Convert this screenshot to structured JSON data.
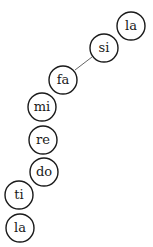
{
  "diagram": {
    "type": "solfege-scale-bubbles",
    "nodes": [
      {
        "id": "la_top",
        "label": "la",
        "cx": 131,
        "cy": 26
      },
      {
        "id": "si",
        "label": "si",
        "cx": 104,
        "cy": 48
      },
      {
        "id": "fa",
        "label": "fa",
        "cx": 63,
        "cy": 80
      },
      {
        "id": "mi",
        "label": "mi",
        "cx": 42,
        "cy": 107
      },
      {
        "id": "re",
        "label": "re",
        "cx": 43,
        "cy": 140
      },
      {
        "id": "do",
        "label": "do",
        "cx": 44,
        "cy": 172
      },
      {
        "id": "ti",
        "label": "ti",
        "cx": 19,
        "cy": 195
      },
      {
        "id": "la_bottom",
        "label": "la",
        "cx": 20,
        "cy": 228
      }
    ],
    "edges": [
      {
        "from": "si",
        "to": "fa",
        "x1": 92,
        "y1": 57,
        "x2": 75,
        "y2": 70
      }
    ],
    "radius": 14,
    "stroke_color": "#1a1a1a",
    "edge_color": "#555555"
  }
}
